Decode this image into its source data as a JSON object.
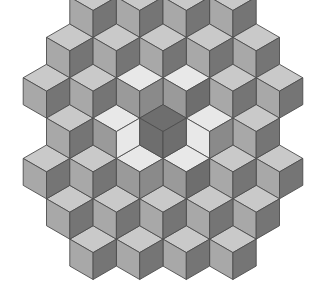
{
  "figure": {
    "canvas": {
      "width": 328,
      "height": 288
    },
    "background_color": "#ffffff",
    "stroke_color": "#4d4d4d",
    "stroke_width": 0.9
  },
  "geometry": {
    "center": {
      "x": 163,
      "y": 145
    },
    "rhomb_half_width": 23.3,
    "rhomb_half_height": 13.45,
    "cube_height": 26.9,
    "note": "Each cube = 3 rhombi: top face, left face, right face"
  },
  "palette": {
    "top_light": "#e8e8e8",
    "top_mid": "#c9c9c9",
    "left_mid": "#a8a8a8",
    "left_dark": "#8a8a8a",
    "right_dark": "#757575",
    "right_darker": "#6b6b6b",
    "center_dark": "#6e6e6e",
    "outline": "#4d4d4d"
  },
  "cubes": [
    {
      "q": 0,
      "r": 0,
      "top": "#6e6e6e",
      "left": "#6e6e6e",
      "right": "#6e6e6e",
      "name": "center-cube"
    },
    {
      "q": 1,
      "r": -1,
      "top": "#e8e8e8",
      "left": "#9a9a9a",
      "right": "#6e6e6e",
      "name": "inner-cube-ne"
    },
    {
      "q": 1,
      "r": 0,
      "top": "#e8e8e8",
      "left": "#e8e8e8",
      "right": "#8a8a8a",
      "name": "inner-cube-e"
    },
    {
      "q": 0,
      "r": 1,
      "top": "#e8e8e8",
      "left": "#9a9a9a",
      "right": "#6e6e6e",
      "name": "inner-cube-se"
    },
    {
      "q": -1,
      "r": 1,
      "top": "#e8e8e8",
      "left": "#9a9a9a",
      "right": "#8a8a8a",
      "name": "inner-cube-sw"
    },
    {
      "q": -1,
      "r": 0,
      "top": "#e8e8e8",
      "left": "#9a9a9a",
      "right": "#e8e8e8",
      "name": "inner-cube-w"
    },
    {
      "q": 0,
      "r": -1,
      "top": "#e8e8e8",
      "left": "#9a9a9a",
      "right": "#8a8a8a",
      "name": "inner-cube-nw"
    },
    {
      "q": 2,
      "r": -2,
      "top": "#c9c9c9",
      "left": "#a8a8a8",
      "right": "#757575",
      "name": "mid-cube-1"
    },
    {
      "q": 2,
      "r": -1,
      "top": "#c9c9c9",
      "left": "#a8a8a8",
      "right": "#757575",
      "name": "mid-cube-2"
    },
    {
      "q": 2,
      "r": 0,
      "top": "#c9c9c9",
      "left": "#a8a8a8",
      "right": "#757575",
      "name": "mid-cube-3"
    },
    {
      "q": 1,
      "r": 1,
      "top": "#c9c9c9",
      "left": "#a8a8a8",
      "right": "#757575",
      "name": "mid-cube-4"
    },
    {
      "q": 0,
      "r": 2,
      "top": "#c9c9c9",
      "left": "#a8a8a8",
      "right": "#757575",
      "name": "mid-cube-5"
    },
    {
      "q": -1,
      "r": 2,
      "top": "#c9c9c9",
      "left": "#a8a8a8",
      "right": "#757575",
      "name": "mid-cube-6"
    },
    {
      "q": -2,
      "r": 2,
      "top": "#c9c9c9",
      "left": "#a8a8a8",
      "right": "#757575",
      "name": "mid-cube-7"
    },
    {
      "q": -2,
      "r": 1,
      "top": "#c9c9c9",
      "left": "#a8a8a8",
      "right": "#757575",
      "name": "mid-cube-8"
    },
    {
      "q": -2,
      "r": 0,
      "top": "#c9c9c9",
      "left": "#a8a8a8",
      "right": "#757575",
      "name": "mid-cube-9"
    },
    {
      "q": -1,
      "r": -1,
      "top": "#c9c9c9",
      "left": "#a8a8a8",
      "right": "#757575",
      "name": "mid-cube-10"
    },
    {
      "q": 0,
      "r": -2,
      "top": "#c9c9c9",
      "left": "#a8a8a8",
      "right": "#757575",
      "name": "mid-cube-11"
    },
    {
      "q": 1,
      "r": -2,
      "top": "#c9c9c9",
      "left": "#a8a8a8",
      "right": "#757575",
      "name": "mid-cube-12"
    },
    {
      "q": 3,
      "r": -3,
      "top": "#c9c9c9",
      "left": "#a8a8a8",
      "right": "#757575",
      "name": "outer-cube-1"
    },
    {
      "q": 3,
      "r": -2,
      "top": "#c9c9c9",
      "left": "#a8a8a8",
      "right": "#757575",
      "name": "outer-cube-2"
    },
    {
      "q": 3,
      "r": -1,
      "top": "#c9c9c9",
      "left": "#a8a8a8",
      "right": "#757575",
      "name": "outer-cube-3"
    },
    {
      "q": 2,
      "r": 1,
      "top": "#c9c9c9",
      "left": "#a8a8a8",
      "right": "#757575",
      "name": "outer-cube-4"
    },
    {
      "q": 1,
      "r": 2,
      "top": "#c9c9c9",
      "left": "#a8a8a8",
      "right": "#757575",
      "name": "outer-cube-5"
    },
    {
      "q": 0,
      "r": 3,
      "top": "#c9c9c9",
      "left": "#a8a8a8",
      "right": "#757575",
      "name": "outer-cube-6"
    },
    {
      "q": -1,
      "r": 3,
      "top": "#c9c9c9",
      "left": "#a8a8a8",
      "right": "#757575",
      "name": "outer-cube-7"
    },
    {
      "q": -2,
      "r": 3,
      "top": "#c9c9c9",
      "left": "#a8a8a8",
      "right": "#757575",
      "name": "outer-cube-8"
    },
    {
      "q": -3,
      "r": 3,
      "top": "#c9c9c9",
      "left": "#a8a8a8",
      "right": "#757575",
      "name": "outer-cube-9"
    },
    {
      "q": -3,
      "r": 2,
      "top": "#c9c9c9",
      "left": "#a8a8a8",
      "right": "#757575",
      "name": "outer-cube-10"
    },
    {
      "q": -3,
      "r": 1,
      "top": "#c9c9c9",
      "left": "#a8a8a8",
      "right": "#757575",
      "name": "outer-cube-11"
    },
    {
      "q": -2,
      "r": -1,
      "top": "#c9c9c9",
      "left": "#a8a8a8",
      "right": "#757575",
      "name": "outer-cube-12"
    },
    {
      "q": -1,
      "r": -2,
      "top": "#c9c9c9",
      "left": "#a8a8a8",
      "right": "#757575",
      "name": "outer-cube-13"
    },
    {
      "q": 0,
      "r": -3,
      "top": "#c9c9c9",
      "left": "#a8a8a8",
      "right": "#757575",
      "name": "outer-cube-14"
    },
    {
      "q": 1,
      "r": -3,
      "top": "#c9c9c9",
      "left": "#a8a8a8",
      "right": "#757575",
      "name": "outer-cube-15"
    },
    {
      "q": 2,
      "r": -3,
      "top": "#c9c9c9",
      "left": "#a8a8a8",
      "right": "#757575",
      "name": "outer-cube-16"
    }
  ],
  "star_overrides": {
    "note": "Inner ring rendered as a six-point star: light rhombi alternate with dark rhombi around the dark central hexagon",
    "star_light": "#e8e8e8",
    "star_dark": "#6e6e6e"
  }
}
